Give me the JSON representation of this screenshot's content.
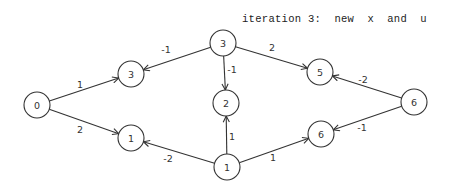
{
  "title": "iteration 3:  new  x  and  u",
  "nodes": [
    {
      "id": "n0",
      "label": "0",
      "x": 37,
      "y": 105
    },
    {
      "id": "n3a",
      "label": "3",
      "x": 131,
      "y": 74
    },
    {
      "id": "n1a",
      "label": "1",
      "x": 131,
      "y": 138
    },
    {
      "id": "n3b",
      "label": "3",
      "x": 223,
      "y": 43
    },
    {
      "id": "n2",
      "label": "2",
      "x": 226,
      "y": 103
    },
    {
      "id": "n1b",
      "label": "1",
      "x": 227,
      "y": 167
    },
    {
      "id": "n5",
      "label": "5",
      "x": 320,
      "y": 72
    },
    {
      "id": "n6a",
      "label": "6",
      "x": 321,
      "y": 134
    },
    {
      "id": "n6b",
      "label": "6",
      "x": 414,
      "y": 102
    }
  ],
  "edges": [
    {
      "from": "n0",
      "to": "n3a",
      "label": "1",
      "lx": 80,
      "ly": 88
    },
    {
      "from": "n0",
      "to": "n1a",
      "label": "2",
      "lx": 80,
      "ly": 133
    },
    {
      "from": "n3b",
      "to": "n3a",
      "label": "-1",
      "lx": 166,
      "ly": 53
    },
    {
      "from": "n3b",
      "to": "n2",
      "label": "-1",
      "lx": 232,
      "ly": 73
    },
    {
      "from": "n3b",
      "to": "n5",
      "label": "2",
      "lx": 272,
      "ly": 51
    },
    {
      "from": "n1b",
      "to": "n1a",
      "label": "-2",
      "lx": 168,
      "ly": 162
    },
    {
      "from": "n1b",
      "to": "n2",
      "label": "1",
      "lx": 232,
      "ly": 140
    },
    {
      "from": "n1b",
      "to": "n6a",
      "label": "1",
      "lx": 273,
      "ly": 161
    },
    {
      "from": "n6b",
      "to": "n5",
      "label": "-2",
      "lx": 363,
      "ly": 83
    },
    {
      "from": "n6b",
      "to": "n6a",
      "label": "-1",
      "lx": 362,
      "ly": 131
    }
  ],
  "node_radius": 13,
  "colors": {
    "stroke": "#333333",
    "background": "#ffffff"
  }
}
